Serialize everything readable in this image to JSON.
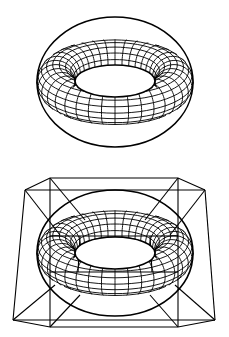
{
  "figure": {
    "panels": [
      {
        "id": "top",
        "label": "",
        "shape": "torus-wireframe",
        "center": [
          115,
          82
        ],
        "outer_rx": 78,
        "outer_ry": 65,
        "hole_rx": 40,
        "hole_ry": 16,
        "hole_cy": 81
      },
      {
        "id": "bottom",
        "label": "",
        "shape": "torus-wireframe-with-cage",
        "center": [
          115,
          253
        ],
        "outer_rx": 78,
        "outer_ry": 63,
        "hole_rx": 40,
        "hole_ry": 16,
        "hole_cy": 253
      }
    ],
    "colors": {
      "stroke": "#000000",
      "background": "#ffffff"
    }
  }
}
